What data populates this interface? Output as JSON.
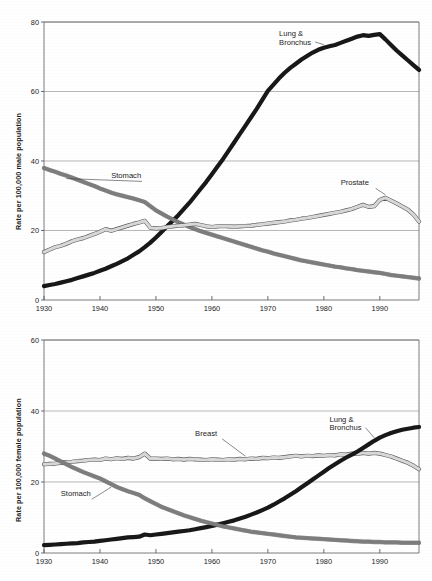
{
  "figure": {
    "background_color": "#ffffff",
    "panels": [
      "male",
      "female"
    ]
  },
  "chart_data": [
    {
      "id": "male",
      "type": "line",
      "title": "",
      "subtitle": "",
      "xlabel": "",
      "ylabel": "Rate per 100,000 male population",
      "xlim": [
        1930,
        1997
      ],
      "ylim": [
        0,
        80
      ],
      "xticks": [
        1930,
        1940,
        1950,
        1960,
        1970,
        1980,
        1990
      ],
      "xtick_labels": [
        "1930",
        "1940",
        "1950",
        "1960",
        "1970",
        "1980",
        "1990"
      ],
      "yticks": [
        0,
        20,
        40,
        60,
        80
      ],
      "ytick_labels": [
        "0",
        "20",
        "40",
        "60",
        "80"
      ],
      "grid": true,
      "grid_axis": "y",
      "legend": "annotations",
      "annotations": [
        {
          "text": "Lung &",
          "text2": "Bronchus",
          "series": "Lung & Bronchus",
          "x": 1972,
          "y": 76
        },
        {
          "text": "Stomach",
          "series": "Stomach",
          "x": 1942,
          "y": 35
        },
        {
          "text": "Prostate",
          "series": "Prostate",
          "x": 1983,
          "y": 33
        }
      ],
      "x": [
        1930,
        1931,
        1932,
        1933,
        1934,
        1935,
        1936,
        1937,
        1938,
        1939,
        1940,
        1941,
        1942,
        1943,
        1944,
        1945,
        1946,
        1947,
        1948,
        1949,
        1950,
        1951,
        1952,
        1953,
        1954,
        1955,
        1956,
        1957,
        1958,
        1959,
        1960,
        1961,
        1962,
        1963,
        1964,
        1965,
        1966,
        1967,
        1968,
        1969,
        1970,
        1971,
        1972,
        1973,
        1974,
        1975,
        1976,
        1977,
        1978,
        1979,
        1980,
        1981,
        1982,
        1983,
        1984,
        1985,
        1986,
        1987,
        1988,
        1989,
        1990,
        1991,
        1992,
        1993,
        1994,
        1995,
        1996,
        1997
      ],
      "series": [
        {
          "name": "Lung & Bronchus",
          "color": "#181818",
          "style": "solid-thick-dark",
          "values": [
            4.0,
            4.3,
            4.6,
            5.0,
            5.4,
            5.8,
            6.3,
            6.8,
            7.3,
            7.8,
            8.4,
            9.0,
            9.7,
            10.4,
            11.2,
            12.0,
            13.0,
            14.0,
            15.2,
            16.5,
            18.0,
            19.6,
            21.2,
            22.8,
            24.4,
            26.2,
            28.0,
            30.0,
            32.0,
            34.0,
            36.2,
            38.4,
            40.6,
            43.0,
            45.4,
            47.8,
            50.2,
            52.6,
            55.0,
            57.6,
            60.2,
            62.0,
            63.8,
            65.4,
            66.8,
            68.0,
            69.2,
            70.2,
            71.2,
            72.0,
            72.6,
            73.0,
            73.4,
            74.0,
            74.6,
            75.2,
            75.8,
            76.2,
            76.0,
            76.3,
            76.5,
            75.0,
            73.4,
            71.8,
            70.4,
            69.0,
            67.6,
            66.2
          ]
        },
        {
          "name": "Stomach",
          "color": "#7d7d7d",
          "style": "solid-thick-gray",
          "values": [
            38.0,
            37.4,
            36.9,
            36.3,
            35.8,
            35.2,
            34.6,
            34.0,
            33.4,
            32.8,
            32.1,
            31.5,
            30.9,
            30.4,
            30.0,
            29.6,
            29.2,
            28.7,
            28.2,
            27.0,
            25.8,
            24.9,
            24.0,
            23.2,
            22.4,
            21.7,
            21.0,
            20.4,
            19.8,
            19.3,
            18.8,
            18.3,
            17.8,
            17.3,
            16.8,
            16.3,
            15.8,
            15.3,
            14.8,
            14.3,
            13.9,
            13.4,
            13.0,
            12.6,
            12.2,
            11.8,
            11.4,
            11.1,
            10.8,
            10.5,
            10.2,
            9.9,
            9.6,
            9.4,
            9.1,
            8.9,
            8.6,
            8.4,
            8.2,
            8.0,
            7.8,
            7.5,
            7.2,
            7.0,
            6.8,
            6.6,
            6.4,
            6.2
          ]
        },
        {
          "name": "Prostate",
          "color": "#d8d8d8",
          "style": "outlined-light",
          "values": [
            13.8,
            14.5,
            15.2,
            15.6,
            16.2,
            16.9,
            17.4,
            17.8,
            18.4,
            19.0,
            19.6,
            20.4,
            19.9,
            20.4,
            20.9,
            21.4,
            21.9,
            22.3,
            22.8,
            20.8,
            20.6,
            20.7,
            21.0,
            21.2,
            21.4,
            21.5,
            21.7,
            21.9,
            21.6,
            21.2,
            21.0,
            21.2,
            21.3,
            21.2,
            21.1,
            21.2,
            21.3,
            21.4,
            21.6,
            21.8,
            22.0,
            22.2,
            22.4,
            22.6,
            22.9,
            23.1,
            23.4,
            23.6,
            23.9,
            24.2,
            24.5,
            24.8,
            25.1,
            25.4,
            25.8,
            26.2,
            26.8,
            27.4,
            26.8,
            27.0,
            28.8,
            29.4,
            28.6,
            27.8,
            26.9,
            26.0,
            24.6,
            22.6
          ]
        }
      ]
    },
    {
      "id": "female",
      "type": "line",
      "title": "",
      "subtitle": "",
      "xlabel": "",
      "ylabel": "Rate per 100,000 female population",
      "xlim": [
        1930,
        1997
      ],
      "ylim": [
        0,
        60
      ],
      "xticks": [
        1930,
        1940,
        1950,
        1960,
        1970,
        1980,
        1990
      ],
      "xtick_labels": [
        "1930",
        "1940",
        "1950",
        "1960",
        "1970",
        "1980",
        "1990"
      ],
      "yticks": [
        0,
        20,
        40,
        60
      ],
      "ytick_labels": [
        "0",
        "20",
        "40",
        "60"
      ],
      "grid": true,
      "grid_axis": "y",
      "legend": "annotations",
      "annotations": [
        {
          "text": "Breast",
          "series": "Breast",
          "x": 1957,
          "y": 33
        },
        {
          "text": "Lung &",
          "text2": "Bronchus",
          "series": "Lung & Bronchus",
          "x": 1981,
          "y": 37
        },
        {
          "text": "Stomach",
          "series": "Stomach",
          "x": 1933,
          "y": 16
        }
      ],
      "x": [
        1930,
        1931,
        1932,
        1933,
        1934,
        1935,
        1936,
        1937,
        1938,
        1939,
        1940,
        1941,
        1942,
        1943,
        1944,
        1945,
        1946,
        1947,
        1948,
        1949,
        1950,
        1951,
        1952,
        1953,
        1954,
        1955,
        1956,
        1957,
        1958,
        1959,
        1960,
        1961,
        1962,
        1963,
        1964,
        1965,
        1966,
        1967,
        1968,
        1969,
        1970,
        1971,
        1972,
        1973,
        1974,
        1975,
        1976,
        1977,
        1978,
        1979,
        1980,
        1981,
        1982,
        1983,
        1984,
        1985,
        1986,
        1987,
        1988,
        1989,
        1990,
        1991,
        1992,
        1993,
        1994,
        1995,
        1996,
        1997
      ],
      "series": [
        {
          "name": "Breast",
          "color": "#d8d8d8",
          "style": "outlined-light",
          "values": [
            25.0,
            25.1,
            25.2,
            25.4,
            25.6,
            25.7,
            25.9,
            26.0,
            26.2,
            26.3,
            26.2,
            26.6,
            26.4,
            26.7,
            26.5,
            26.8,
            26.6,
            27.0,
            28.0,
            26.6,
            26.6,
            26.5,
            26.6,
            26.4,
            26.5,
            26.3,
            26.5,
            26.4,
            26.3,
            26.2,
            26.4,
            26.3,
            26.2,
            26.4,
            26.3,
            26.5,
            26.4,
            26.6,
            26.5,
            26.8,
            26.7,
            26.9,
            26.8,
            27.0,
            27.2,
            27.4,
            27.2,
            27.4,
            27.3,
            27.5,
            27.4,
            27.6,
            27.5,
            27.8,
            27.7,
            28.0,
            27.9,
            28.2,
            28.0,
            28.2,
            28.0,
            27.6,
            27.2,
            26.6,
            26.0,
            25.4,
            24.6,
            23.6
          ]
        },
        {
          "name": "Lung & Bronchus",
          "color": "#181818",
          "style": "solid-thick-dark",
          "values": [
            2.2,
            2.3,
            2.4,
            2.5,
            2.6,
            2.7,
            2.8,
            3.0,
            3.1,
            3.2,
            3.4,
            3.6,
            3.8,
            4.0,
            4.2,
            4.4,
            4.5,
            4.6,
            5.2,
            5.0,
            5.2,
            5.4,
            5.6,
            5.8,
            6.0,
            6.2,
            6.4,
            6.7,
            7.0,
            7.3,
            7.6,
            8.0,
            8.4,
            8.8,
            9.2,
            9.7,
            10.2,
            10.8,
            11.4,
            12.1,
            12.8,
            13.6,
            14.5,
            15.4,
            16.4,
            17.4,
            18.5,
            19.6,
            20.7,
            21.8,
            22.9,
            24.0,
            25.0,
            26.0,
            26.9,
            27.7,
            28.6,
            29.6,
            30.6,
            31.6,
            32.5,
            33.2,
            33.8,
            34.3,
            34.7,
            35.0,
            35.3,
            35.5
          ]
        },
        {
          "name": "Stomach",
          "color": "#7d7d7d",
          "style": "solid-thick-gray",
          "values": [
            28.0,
            27.4,
            26.6,
            25.8,
            25.0,
            24.2,
            23.5,
            22.8,
            22.2,
            21.6,
            21.0,
            20.2,
            19.4,
            18.6,
            18.0,
            17.4,
            16.9,
            16.4,
            15.4,
            14.6,
            13.8,
            13.0,
            12.4,
            11.8,
            11.2,
            10.6,
            10.1,
            9.6,
            9.1,
            8.7,
            8.3,
            7.9,
            7.5,
            7.2,
            6.9,
            6.6,
            6.3,
            6.0,
            5.8,
            5.6,
            5.4,
            5.2,
            5.0,
            4.8,
            4.6,
            4.4,
            4.3,
            4.2,
            4.1,
            4.0,
            3.9,
            3.8,
            3.7,
            3.6,
            3.5,
            3.4,
            3.3,
            3.2,
            3.2,
            3.1,
            3.1,
            3.0,
            3.0,
            3.0,
            2.9,
            2.9,
            2.9,
            2.9
          ]
        }
      ]
    }
  ]
}
